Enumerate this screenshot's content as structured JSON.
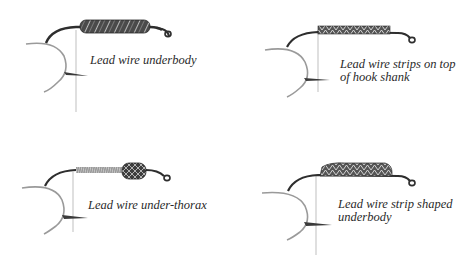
{
  "figure": {
    "background": "#ffffff",
    "ink_color": "#2a2a2a",
    "panels": [
      {
        "id": "underbody",
        "caption_lines": [
          "Lead wire underbody"
        ],
        "wrap_style": "full-shank coiled lead wire"
      },
      {
        "id": "strips-on-top",
        "caption_lines": [
          "Lead wire strips on top",
          "of hook shank"
        ],
        "wrap_style": "flat strips lashed on top of shank"
      },
      {
        "id": "under-thorax",
        "caption_lines": [
          "Lead wire under-thorax"
        ],
        "wrap_style": "short lead wrap at thorax only"
      },
      {
        "id": "strip-shaped",
        "caption_lines": [
          "Lead wire strip shaped",
          "underbody"
        ],
        "wrap_style": "layered strips shaped into underbody"
      }
    ]
  }
}
